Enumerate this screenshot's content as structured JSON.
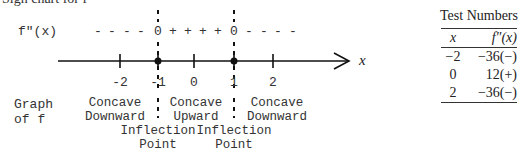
{
  "title": "Sign chart for f″",
  "sign_chart": {
    "row_label": "f″(x)",
    "signs": [
      {
        "text": "-",
        "x": 98
      },
      {
        "text": "-",
        "x": 112
      },
      {
        "text": "-",
        "x": 127
      },
      {
        "text": "-",
        "x": 141
      },
      {
        "text": "0",
        "x": 158
      },
      {
        "text": "+",
        "x": 173
      },
      {
        "text": "+",
        "x": 188
      },
      {
        "text": "+",
        "x": 203
      },
      {
        "text": "+",
        "x": 218
      },
      {
        "text": "0",
        "x": 234
      },
      {
        "text": "-",
        "x": 249
      },
      {
        "text": "-",
        "x": 264
      },
      {
        "text": "-",
        "x": 278
      },
      {
        "text": "-",
        "x": 293
      }
    ],
    "axis_label": "x",
    "ticks": [
      {
        "label": "-2",
        "x": 120,
        "critical": false
      },
      {
        "label": "-1",
        "x": 158,
        "critical": true
      },
      {
        "label": "0",
        "x": 194,
        "critical": false
      },
      {
        "label": "1",
        "x": 234,
        "critical": true
      },
      {
        "label": "2",
        "x": 273,
        "critical": false
      }
    ],
    "graph_label": [
      "Graph",
      "of f"
    ],
    "regions": [
      {
        "line1": "Concave",
        "line2": "Downward",
        "x": 115
      },
      {
        "line1": "Concave",
        "line2": "Upward",
        "x": 196
      },
      {
        "line1": "Concave",
        "line2": "Downward",
        "x": 277
      }
    ],
    "inflection_points": [
      {
        "line1": "Inflection",
        "line2": "Point",
        "x": 158
      },
      {
        "line1": "Inflection",
        "line2": "Point",
        "x": 234
      }
    ]
  },
  "test_numbers": {
    "heading": "Test Numbers",
    "columns": [
      "x",
      "f″(x)"
    ],
    "rows": [
      {
        "x": "−2",
        "value": "−36(−)"
      },
      {
        "x": "0",
        "value": "12(+)"
      },
      {
        "x": "2",
        "value": "−36(−)"
      }
    ]
  }
}
